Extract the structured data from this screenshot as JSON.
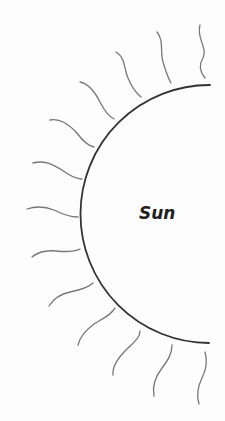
{
  "diagram": {
    "label": "Sun",
    "colors": {
      "background": "#fdfdfd",
      "sun_outline": "#333333",
      "rays": "#777777",
      "label": "#222222"
    },
    "sun": {
      "shape": "semicircle-arc",
      "center": [
        215,
        214
      ],
      "radius": 129
    },
    "rays": [
      {
        "d": "M200,25 C196,38 208,48 203,58 C198,66 200,72 205,78"
      },
      {
        "d": "M157,32 C164,40 160,52 163,62 C166,72 168,78 171,83"
      },
      {
        "d": "M116,52 C126,58 124,70 128,78 C132,88 136,93 141,97"
      },
      {
        "d": "M80,82 C90,84 96,94 100,102 C104,110 108,116 114,119"
      },
      {
        "d": "M50,120 C60,118 68,124 76,132 C82,140 88,146 94,147"
      },
      {
        "d": "M33,163 C44,160 52,164 62,170 C70,176 76,179 82,179"
      },
      {
        "d": "M27,209 C36,206 44,206 54,210 C62,214 70,217 78,217"
      },
      {
        "d": "M32,257 C38,252 46,250 56,251 C66,252 74,252 80,249"
      },
      {
        "d": "M49,306 C54,298 60,294 70,292 C80,290 88,288 93,283"
      },
      {
        "d": "M78,345 C80,336 86,330 94,324 C104,318 112,314 115,308"
      },
      {
        "d": "M113,375 C112,366 118,358 126,350 C134,342 140,338 140,331"
      },
      {
        "d": "M154,396 C152,386 156,376 162,368 C168,360 172,354 172,345"
      },
      {
        "d": "M199,404 C196,394 198,386 202,378 C206,370 208,362 205,352"
      }
    ]
  }
}
